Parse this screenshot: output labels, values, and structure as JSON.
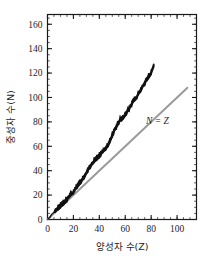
{
  "chart_data": {
    "type": "line",
    "title": "",
    "xlabel": "양성자 수(Z)",
    "ylabel": "중성자 수(N)",
    "xlim": [
      0,
      115
    ],
    "ylim": [
      0,
      168
    ],
    "xticks": [
      0,
      20,
      40,
      60,
      80,
      100
    ],
    "yticks": [
      0,
      20,
      40,
      60,
      80,
      100,
      120,
      140,
      160
    ],
    "xtick_labels": [
      "0",
      "20",
      "40",
      "60",
      "80",
      "100"
    ],
    "ytick_labels": [
      "0",
      "20",
      "40",
      "60",
      "80",
      "100",
      "120",
      "140",
      "160"
    ],
    "grid": false,
    "legend": "none",
    "minor_ticks": true,
    "minor_tick_step_x": 5,
    "minor_tick_step_y": 5,
    "series": [
      {
        "name": "stable-nuclide-band",
        "style": "jagged-band",
        "color": "#111111",
        "x": [
          0,
          1,
          2,
          3,
          4,
          5,
          6,
          7,
          8,
          9,
          10,
          11,
          12,
          13,
          14,
          15,
          16,
          17,
          18,
          19,
          20,
          21,
          22,
          23,
          24,
          25,
          26,
          27,
          28,
          29,
          30,
          31,
          32,
          33,
          34,
          35,
          36,
          37,
          38,
          39,
          40,
          41,
          42,
          43,
          44,
          45,
          46,
          47,
          48,
          49,
          50,
          51,
          52,
          53,
          54,
          55,
          56,
          57,
          58,
          59,
          60,
          61,
          62,
          63,
          64,
          65,
          66,
          67,
          68,
          69,
          70,
          71,
          72,
          73,
          74,
          75,
          76,
          77,
          78,
          79,
          80,
          81,
          82
        ],
        "y": [
          0,
          1,
          2,
          4,
          5,
          6,
          7,
          8,
          9,
          10,
          11,
          12,
          13,
          14,
          15,
          16,
          18,
          19,
          21,
          21,
          22,
          24,
          26,
          27,
          29,
          30,
          31,
          33,
          34,
          36,
          38,
          40,
          42,
          43,
          45,
          46,
          48,
          49,
          50,
          51,
          52,
          53,
          55,
          56,
          57,
          58,
          60,
          61,
          64,
          66,
          69,
          71,
          74,
          75,
          78,
          79,
          82,
          82,
          83,
          84,
          86,
          87,
          90,
          90,
          93,
          94,
          97,
          98,
          99,
          100,
          103,
          104,
          106,
          108,
          110,
          111,
          114,
          115,
          117,
          118,
          120,
          123,
          126
        ],
        "band_half_width": 2.2
      },
      {
        "name": "N = Z reference line",
        "style": "straight-line",
        "color": "#9a9a9a",
        "x": [
          0,
          108
        ],
        "y": [
          0,
          108
        ]
      }
    ],
    "annotations": [
      {
        "text": "N = Z",
        "x": 76,
        "y": 78,
        "italic": true
      }
    ]
  },
  "axes": {
    "x_title": "양성자 수(Z)",
    "y_title": "중성자 수(N)",
    "frame_color": "#1a1a1a"
  },
  "colors": {
    "data_black": "#111111",
    "reference_gray": "#9a9a9a",
    "axis": "#1a1a1a",
    "background": "#ffffff"
  }
}
